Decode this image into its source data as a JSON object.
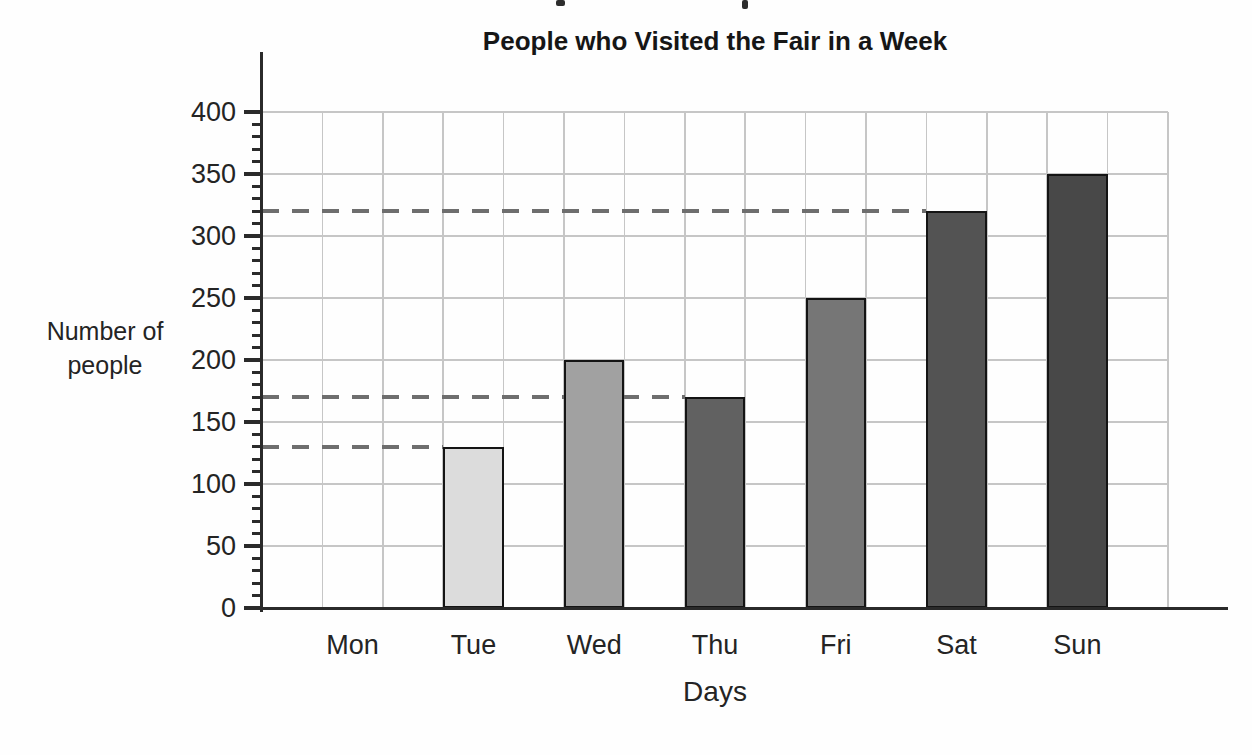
{
  "page": {
    "background": "#fefefe",
    "description_note": "Scanned textbook bar graph"
  },
  "chart_data": {
    "type": "bar",
    "title": "People who Visited the Fair in a Week",
    "xlabel": "Days",
    "ylabel": "Number of people",
    "ylabel_lines": [
      "Number of",
      "people"
    ],
    "categories": [
      "Mon",
      "Tue",
      "Wed",
      "Thu",
      "Fri",
      "Sat",
      "Sun"
    ],
    "values": [
      0,
      130,
      200,
      170,
      250,
      320,
      350
    ],
    "bar_colors": [
      "",
      "#dcdcdc",
      "#a1a1a1",
      "#616161",
      "#767676",
      "#535353",
      "#484848"
    ],
    "ylim": [
      0,
      400
    ],
    "y_tick_step": 50,
    "y_minor_tick_step": 10,
    "y_tick_labels": [
      "0",
      "50",
      "100",
      "150",
      "200",
      "250",
      "300",
      "350",
      "400"
    ],
    "grid": true,
    "legend": "none",
    "guide_lines": [
      {
        "value": 130,
        "to_category": "Tue"
      },
      {
        "value": 170,
        "to_category": "Thu"
      },
      {
        "value": 320,
        "to_category": "Sat"
      }
    ],
    "colors": {
      "axis": "#2a2a2a",
      "grid": "#c6c6c6",
      "guide": "#6e6e6e",
      "bar_border": "#141414",
      "text": "#242424"
    }
  }
}
